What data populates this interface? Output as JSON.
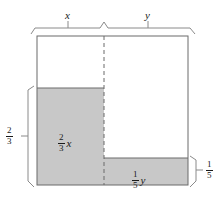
{
  "figure": {
    "background_color": "#ffffff",
    "shade_color": "#c8c8c8",
    "line_color": "#4d4d4d",
    "text_color": "#1a1a1a",
    "outer_box": {
      "x": 37,
      "y": 36,
      "width": 151,
      "height": 149
    },
    "divider": {
      "type": "dashed-vertical",
      "x": 104
    },
    "left_shaded": {
      "x": 37,
      "y": 88,
      "width": 67,
      "height": 97
    },
    "right_shaded": {
      "x": 104,
      "y": 158,
      "width": 84,
      "height": 27
    }
  },
  "labels": {
    "top_left_width": "x",
    "top_right_width": "y",
    "left_height_numerator": "2",
    "left_height_denominator": "3",
    "right_height_numerator": "1",
    "right_height_denominator": "5",
    "left_area_numerator": "2",
    "left_area_denominator": "3",
    "left_area_variable": "x",
    "right_area_numerator": "1",
    "right_area_denominator": "5",
    "right_area_variable": "y"
  }
}
